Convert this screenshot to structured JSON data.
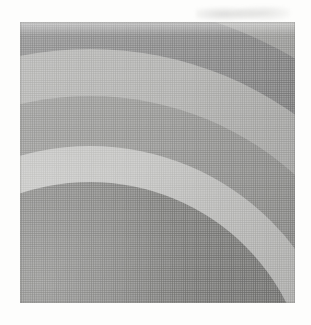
{
  "page": {
    "background_color": "#fdfdfc",
    "width": 311,
    "height": 325,
    "caption": ""
  },
  "figure": {
    "name": "concentric-band-grayscale-plate",
    "frame": {
      "left": 20,
      "top": 22,
      "width": 275,
      "height": 281
    },
    "media": "halftone print scan",
    "label": ""
  },
  "chart_data": {
    "type": "heatmap",
    "title": "",
    "xlabel": "",
    "ylabel": "",
    "center": {
      "x": 70,
      "y": 380
    },
    "bands": [
      {
        "index": 1,
        "name": "outer-dark-band",
        "radius": 510,
        "color": "#76767a",
        "tone": "dark"
      },
      {
        "index": 2,
        "name": "light-band-2",
        "radius": 460,
        "color": "#a6a6a4",
        "tone": "light-mid"
      },
      {
        "index": 3,
        "name": "mid-band-3",
        "radius": 400,
        "color": "#8e8e8e",
        "tone": "mid-dark"
      },
      {
        "index": 4,
        "name": "light-band-4",
        "radius": 353,
        "color": "#b4b4b2",
        "tone": "light"
      },
      {
        "index": 5,
        "name": "mid-band-5",
        "radius": 306,
        "color": "#9c9c9a",
        "tone": "mid"
      },
      {
        "index": 6,
        "name": "lightest-band-6",
        "radius": 256,
        "color": "#c6c6c4",
        "tone": "lightest"
      },
      {
        "index": 7,
        "name": "inner-dark-band-7",
        "radius": 220,
        "color": "#8a8a88",
        "tone": "inner-dark"
      }
    ],
    "background_region": {
      "name": "outer-dark-field",
      "color": "#6f6f73",
      "tone": "darkest"
    },
    "legend": [],
    "grid": false
  },
  "artifacts": {
    "smudge": {
      "name": "paper-smudge",
      "color": "#9a9a98"
    },
    "halftone": {
      "name": "halftone-screen",
      "dot_pitch_px": 2.2
    }
  }
}
